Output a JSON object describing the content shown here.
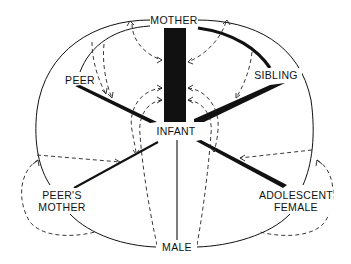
{
  "diagram": {
    "title": "",
    "nodes": {
      "mother": "MOTHER",
      "infant": "INFANT",
      "male": "MALE",
      "peer": "PEER",
      "sibling": "SIBLING",
      "peers_mother_line1": "PEER'S",
      "peers_mother_line2": "MOTHER",
      "adolescent_female_line1": "ADOLESCENT",
      "adolescent_female_line2": "FEMALE"
    },
    "edges": [
      {
        "from": "MOTHER",
        "to": "INFANT",
        "style": "very thick bar"
      },
      {
        "from": "SIBLING",
        "to": "INFANT",
        "style": "thick wedge"
      },
      {
        "from": "PEER",
        "to": "INFANT",
        "style": "thick wedge"
      },
      {
        "from": "ADOLESCENT FEMALE",
        "to": "INFANT",
        "style": "thick wedge"
      },
      {
        "from": "PEER'S MOTHER",
        "to": "INFANT",
        "style": "medium line"
      },
      {
        "from": "MALE",
        "to": "INFANT",
        "style": "thin line"
      },
      {
        "from": "MOTHER",
        "to": "SIBLING",
        "style": "thick arc"
      },
      {
        "from": "MOTHER",
        "to": "PEER",
        "style": "thin arc"
      },
      {
        "from": "MOTHER",
        "to": "PEER'S MOTHER",
        "style": "thin arc"
      },
      {
        "from": "MOTHER",
        "to": "ADOLESCENT FEMALE",
        "style": "thin arc"
      },
      {
        "from": "PEER'S MOTHER",
        "to": "MALE",
        "style": "thin arc"
      },
      {
        "from": "ADOLESCENT FEMALE",
        "to": "MALE",
        "style": "thin arc"
      }
    ],
    "legend": {
      "solid": "interaction (thickness = strength)",
      "dashed": "influence arrows"
    }
  }
}
